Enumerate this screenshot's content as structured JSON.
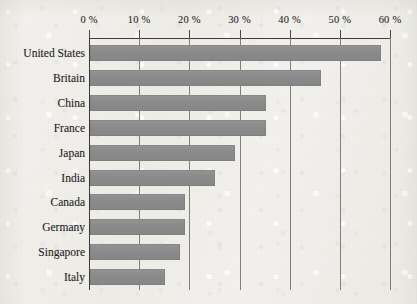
{
  "chart_data": {
    "type": "bar",
    "orientation": "horizontal",
    "title": "",
    "xlabel": "",
    "ylabel": "",
    "xlim": [
      0,
      60
    ],
    "grid": true,
    "legend": false,
    "xtick_labels": [
      "0 %",
      "10 %",
      "20 %",
      "30 %",
      "40 %",
      "50 %",
      "60 %"
    ],
    "xticks": [
      0,
      10,
      20,
      30,
      40,
      50,
      60
    ],
    "categories": [
      "United States",
      "Britain",
      "China",
      "France",
      "Japan",
      "India",
      "Canada",
      "Germany",
      "Singapore",
      "Italy"
    ],
    "values": [
      58,
      46,
      35,
      35,
      29,
      25,
      19,
      19,
      18,
      15
    ],
    "value_unit": "%",
    "bars": [
      {
        "label": "United States",
        "value": 58
      },
      {
        "label": "Britain",
        "value": 46
      },
      {
        "label": "China",
        "value": 35
      },
      {
        "label": "France",
        "value": 35
      },
      {
        "label": "Japan",
        "value": 29
      },
      {
        "label": "India",
        "value": 25
      },
      {
        "label": "Canada",
        "value": 19
      },
      {
        "label": "Germany",
        "value": 19
      },
      {
        "label": "Singapore",
        "value": 18
      },
      {
        "label": "Italy",
        "value": 15
      }
    ]
  },
  "colors": {
    "bar_fill": "#8a8a8a",
    "axis": "#3f3b37",
    "gridline": "#6e6a64",
    "text": "#23201c",
    "paper": "#f2f0ec"
  }
}
